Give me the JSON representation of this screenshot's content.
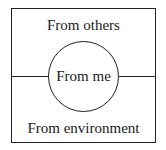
{
  "diagram": {
    "type": "nested-regions",
    "regions": {
      "top": "From others",
      "center": "From me",
      "bottom": "From environment"
    }
  }
}
